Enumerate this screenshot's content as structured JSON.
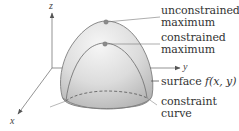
{
  "figure": {
    "axes": {
      "z_label": "z",
      "x_label": "x",
      "y_label": "y"
    },
    "labels": {
      "unconstrained_line1": "unconstrained",
      "unconstrained_line2": "maximum",
      "constrained_line1": "constrained",
      "constrained_line2": "maximum",
      "surface_prefix": "surface ",
      "surface_func": "f(x, y)",
      "constraint_line1": "constraint",
      "constraint_line2": "curve"
    },
    "colors": {
      "surface_light": "#f2f2f2",
      "surface_dark": "#bdbdbd",
      "edge": "#808080",
      "point": "#8c8c8c",
      "text": "#333333"
    }
  }
}
